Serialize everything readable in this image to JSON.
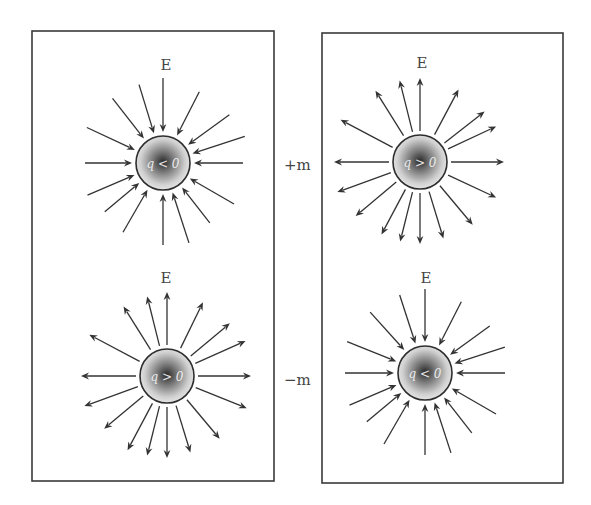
{
  "colors": {
    "stroke": "#333333",
    "box": "#3a3a3a",
    "text": "#444444",
    "sphere_center": "#2a2a2a",
    "sphere_edge": "#e6e6e6"
  },
  "side_labels": {
    "top": "+m",
    "bottom": "−m"
  },
  "panels": [
    {
      "id": "left",
      "box": {
        "x": 32,
        "y": 31,
        "w": 242,
        "h": 450
      }
    },
    {
      "id": "right",
      "box": {
        "x": 322,
        "y": 33,
        "w": 241,
        "h": 450
      }
    }
  ],
  "charges": [
    {
      "id": "top-left",
      "field_label": "E",
      "label": "q < 0",
      "direction": "inward",
      "center": [
        163,
        163
      ],
      "radius": 27,
      "label_pos": [
        166,
        70
      ],
      "arrows": [
        {
          "angle": -90,
          "len": 83
        },
        {
          "angle": -107,
          "len": 80
        },
        {
          "angle": -128,
          "len": 80
        },
        {
          "angle": -155,
          "len": 82
        },
        {
          "angle": 180,
          "len": 76
        },
        {
          "angle": 157,
          "len": 80
        },
        {
          "angle": 140,
          "len": 74
        },
        {
          "angle": 120,
          "len": 78
        },
        {
          "angle": 90,
          "len": 80
        },
        {
          "angle": 72,
          "len": 82
        },
        {
          "angle": 52,
          "len": 74
        },
        {
          "angle": 30,
          "len": 80
        },
        {
          "angle": 0,
          "len": 78
        },
        {
          "angle": -18,
          "len": 84
        },
        {
          "angle": -36,
          "len": 80
        },
        {
          "angle": -63,
          "len": 78
        }
      ]
    },
    {
      "id": "top-right",
      "field_label": "E",
      "label": "q > 0",
      "direction": "outward",
      "center": [
        420,
        162
      ],
      "radius": 27,
      "label_pos": [
        422,
        68
      ],
      "arrows": [
        {
          "angle": -90,
          "len": 82
        },
        {
          "angle": -104,
          "len": 82
        },
        {
          "angle": -122,
          "len": 82
        },
        {
          "angle": -152,
          "len": 88
        },
        {
          "angle": 180,
          "len": 84
        },
        {
          "angle": 160,
          "len": 86
        },
        {
          "angle": 140,
          "len": 82
        },
        {
          "angle": 118,
          "len": 80
        },
        {
          "angle": 104,
          "len": 80
        },
        {
          "angle": 90,
          "len": 80
        },
        {
          "angle": 73,
          "len": 78
        },
        {
          "angle": 50,
          "len": 80
        },
        {
          "angle": 25,
          "len": 82
        },
        {
          "angle": 0,
          "len": 82
        },
        {
          "angle": -25,
          "len": 82
        },
        {
          "angle": -38,
          "len": 80
        },
        {
          "angle": -62,
          "len": 80
        }
      ]
    },
    {
      "id": "bottom-left",
      "field_label": "E",
      "label": "q > 0",
      "direction": "outward",
      "center": [
        167,
        376
      ],
      "radius": 27,
      "label_pos": [
        166,
        283
      ],
      "arrows": [
        {
          "angle": -90,
          "len": 82
        },
        {
          "angle": -104,
          "len": 80
        },
        {
          "angle": -122,
          "len": 80
        },
        {
          "angle": -152,
          "len": 86
        },
        {
          "angle": 180,
          "len": 84
        },
        {
          "angle": 160,
          "len": 86
        },
        {
          "angle": 140,
          "len": 80
        },
        {
          "angle": 118,
          "len": 82
        },
        {
          "angle": 104,
          "len": 80
        },
        {
          "angle": 90,
          "len": 80
        },
        {
          "angle": 73,
          "len": 78
        },
        {
          "angle": 50,
          "len": 80
        },
        {
          "angle": 22,
          "len": 84
        },
        {
          "angle": 0,
          "len": 82
        },
        {
          "angle": -24,
          "len": 84
        },
        {
          "angle": -40,
          "len": 80
        },
        {
          "angle": -64,
          "len": 80
        }
      ]
    },
    {
      "id": "bottom-right",
      "field_label": "E",
      "label": "q < 0",
      "direction": "inward",
      "center": [
        425,
        373
      ],
      "radius": 27,
      "label_pos": [
        426,
        283
      ],
      "arrows": [
        {
          "angle": -90,
          "len": 82
        },
        {
          "angle": -108,
          "len": 80
        },
        {
          "angle": -132,
          "len": 80
        },
        {
          "angle": -158,
          "len": 82
        },
        {
          "angle": 180,
          "len": 78
        },
        {
          "angle": 157,
          "len": 80
        },
        {
          "angle": 140,
          "len": 74
        },
        {
          "angle": 120,
          "len": 80
        },
        {
          "angle": 90,
          "len": 80
        },
        {
          "angle": 72,
          "len": 82
        },
        {
          "angle": 52,
          "len": 74
        },
        {
          "angle": 30,
          "len": 80
        },
        {
          "angle": 0,
          "len": 78
        },
        {
          "angle": -18,
          "len": 82
        },
        {
          "angle": -36,
          "len": 78
        },
        {
          "angle": -63,
          "len": 78
        }
      ]
    }
  ]
}
